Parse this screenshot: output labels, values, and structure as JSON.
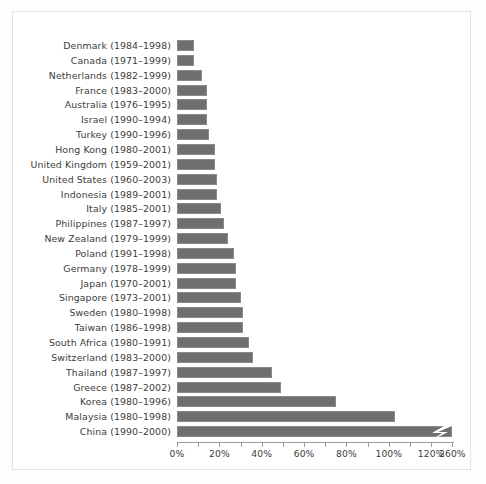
{
  "chart_data": {
    "type": "bar",
    "orientation": "horizontal",
    "title": "",
    "xlabel": "",
    "ylabel": "",
    "grid": false,
    "legend": null,
    "axis_break": {
      "present": true,
      "note": "x-axis is broken between 120% and 260%; the China bar is drawn truncated with a zigzag break symbol",
      "last_tick_label": "260%",
      "break_after_percent": 130
    },
    "xlim": [
      0,
      130
    ],
    "xticks": [
      0,
      20,
      40,
      60,
      80,
      100,
      120
    ],
    "xtick_labels": [
      "0%",
      "20%",
      "40%",
      "60%",
      "80%",
      "100%",
      "120%",
      "260%"
    ],
    "minor_tick_step": 10,
    "categories": [
      "Denmark (1984–1998)",
      "Canada (1971–1999)",
      "Netherlands (1982–1999)",
      "France (1983–2000)",
      "Australia (1976–1995)",
      "Israel (1990–1994)",
      "Turkey (1990–1996)",
      "Hong Kong (1980–2001)",
      "United Kingdom (1959–2001)",
      "United States (1960–2003)",
      "Indonesia (1989–2001)",
      "Italy (1985–2001)",
      "Philippines (1987–1997)",
      "New Zealand (1979–1999)",
      "Poland (1991–1998)",
      "Germany (1978–1999)",
      "Japan (1970–2001)",
      "Singapore (1973–2001)",
      "Sweden (1980–1998)",
      "Taiwan (1986–1998)",
      "South Africa (1980–1991)",
      "Switzerland (1983–2000)",
      "Thailand (1987–1997)",
      "Greece (1987–2002)",
      "Korea (1980–1996)",
      "Malaysia (1980–1998)",
      "China (1990–2000)"
    ],
    "values": [
      8,
      8,
      12,
      14,
      14,
      14,
      15,
      18,
      18,
      19,
      19,
      21,
      22,
      24,
      27,
      28,
      28,
      30,
      31,
      31,
      34,
      36,
      45,
      49,
      75,
      103,
      260
    ],
    "plotted_widths_percent": [
      8,
      8,
      12,
      14,
      14,
      14,
      15,
      18,
      18,
      19,
      19,
      21,
      22,
      24,
      27,
      28,
      28,
      30,
      31,
      31,
      34,
      36,
      45,
      49,
      75,
      103,
      130
    ],
    "country_names": [
      "Denmark",
      "Canada",
      "Netherlands",
      "France",
      "Australia",
      "Israel",
      "Turkey",
      "Hong Kong",
      "United Kingdom",
      "United States",
      "Indonesia",
      "Italy",
      "Philippines",
      "New Zealand",
      "Poland",
      "Germany",
      "Japan",
      "Singapore",
      "Sweden",
      "Taiwan",
      "South Africa",
      "Switzerland",
      "Thailand",
      "Greece",
      "Korea",
      "Malaysia",
      "China"
    ],
    "periods": [
      "1984–1998",
      "1971–1999",
      "1982–1999",
      "1983–2000",
      "1976–1995",
      "1990–1994",
      "1990–1996",
      "1980–2001",
      "1959–2001",
      "1960–2003",
      "1989–2001",
      "1985–2001",
      "1987–1997",
      "1979–1999",
      "1991–1998",
      "1978–1999",
      "1970–2001",
      "1973–2001",
      "1980–1998",
      "1986–1998",
      "1980–1991",
      "1983–2000",
      "1987–1997",
      "1987–2002",
      "1980–1996",
      "1980–1998",
      "1990–2000"
    ]
  },
  "style": {
    "bar_fill": "#6f6f6f",
    "bar_edge": "#8a8a8a",
    "axis_color": "#9a9a9a",
    "text_color": "#3c3c3c",
    "frame_color": "#e3e3e3",
    "background": "#ffffff"
  }
}
